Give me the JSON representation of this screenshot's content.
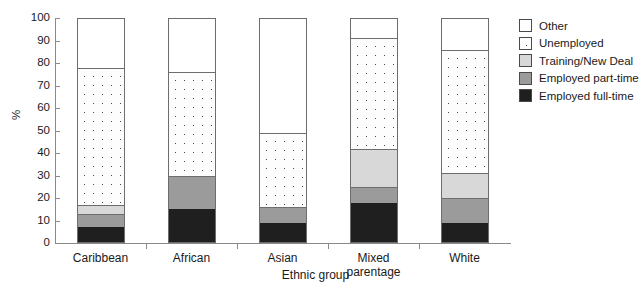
{
  "chart_data": {
    "type": "bar",
    "subtype": "stacked-bar",
    "title": "",
    "xlabel": "Ethnic group",
    "ylabel": "%",
    "ylim": [
      0,
      100
    ],
    "ytick_step": 10,
    "yticks": [
      0,
      10,
      20,
      30,
      40,
      50,
      60,
      70,
      80,
      90,
      100
    ],
    "ytick_labels": [
      "0",
      "10",
      "20",
      "30",
      "40",
      "50",
      "60",
      "70",
      "80",
      "90",
      "100"
    ],
    "grid": false,
    "legend_position": "right",
    "categories": [
      "Caribbean",
      "African",
      "Asian",
      "Mixed parentage",
      "White"
    ],
    "category_labels": [
      "Caribbean",
      "African",
      "Asian",
      "Mixed\nparentage",
      "White"
    ],
    "series": [
      {
        "name": "Employed full-time",
        "key": "fulltime",
        "color": "#1f1f1f",
        "values": [
          7,
          15,
          9,
          18,
          9
        ]
      },
      {
        "name": "Employed part-time",
        "key": "parttime",
        "color": "#9b9b9b",
        "values": [
          6,
          15,
          7,
          7,
          11
        ]
      },
      {
        "name": "Training/New Deal",
        "key": "training",
        "color": "#d8d8d8",
        "values": [
          4,
          0,
          0,
          17,
          11
        ]
      },
      {
        "name": "Unemployed",
        "key": "unemployed",
        "color": "#ffffff",
        "values": [
          61,
          46,
          33,
          49,
          55
        ]
      },
      {
        "name": "Other",
        "key": "other",
        "color": "#ffffff",
        "values": [
          22,
          24,
          51,
          9,
          14
        ]
      }
    ],
    "cumulative_tops": {
      "Caribbean": {
        "fulltime": 7,
        "parttime": 13,
        "training": 17,
        "unemployed": 78,
        "other": 100
      },
      "African": {
        "fulltime": 15,
        "parttime": 30,
        "training": 30,
        "unemployed": 76,
        "other": 100
      },
      "Asian": {
        "fulltime": 9,
        "parttime": 16,
        "training": 16,
        "unemployed": 49,
        "other": 100
      },
      "Mixed parentage": {
        "fulltime": 18,
        "parttime": 25,
        "training": 42,
        "unemployed": 91,
        "other": 100
      },
      "White": {
        "fulltime": 9,
        "parttime": 20,
        "training": 31,
        "unemployed": 86,
        "other": 100
      }
    }
  },
  "legend": {
    "items": [
      {
        "label": "Other",
        "swatch": "sw-other"
      },
      {
        "label": "Unemployed",
        "swatch": "sw-unemployed"
      },
      {
        "label": "Training/New Deal",
        "swatch": "sw-training"
      },
      {
        "label": "Employed part-time",
        "swatch": "sw-parttime"
      },
      {
        "label": "Employed full-time",
        "swatch": "sw-fulltime"
      }
    ]
  },
  "axes": {
    "y_title": "%",
    "x_title": "Ethnic group"
  }
}
